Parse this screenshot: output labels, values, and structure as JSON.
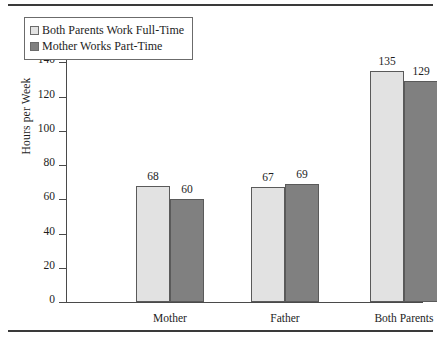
{
  "chart_data": {
    "type": "bar",
    "title": "",
    "xlabel": "",
    "ylabel": "Hours per Week",
    "categories": [
      "Mother",
      "Father",
      "Both Parents"
    ],
    "series": [
      {
        "name": "Both Parents Work Full-Time",
        "values": [
          68,
          67,
          135
        ],
        "color": "#e2e2e2"
      },
      {
        "name": "Mother Works Part-Time",
        "values": [
          60,
          69,
          129
        ],
        "color": "#808080"
      }
    ],
    "ylim": [
      0,
      160
    ],
    "yticks": [
      0,
      20,
      40,
      60,
      80,
      100,
      120,
      140,
      160
    ],
    "ytick_labels": [
      "0",
      "20",
      "40",
      "60",
      "80",
      "100",
      "120",
      "140",
      "160"
    ],
    "grid": false,
    "legend_position": "top-left",
    "data_labels": [
      {
        "category": "Mother",
        "series": "Both Parents Work Full-Time",
        "value": "68"
      },
      {
        "category": "Mother",
        "series": "Mother Works Part-Time",
        "value": "60"
      },
      {
        "category": "Father",
        "series": "Both Parents Work Full-Time",
        "value": "67"
      },
      {
        "category": "Father",
        "series": "Mother Works Part-Time",
        "value": "69"
      },
      {
        "category": "Both Parents",
        "series": "Both Parents Work Full-Time",
        "value": "135"
      },
      {
        "category": "Both Parents",
        "series": "Mother Works Part-Time",
        "value": "129"
      }
    ]
  }
}
